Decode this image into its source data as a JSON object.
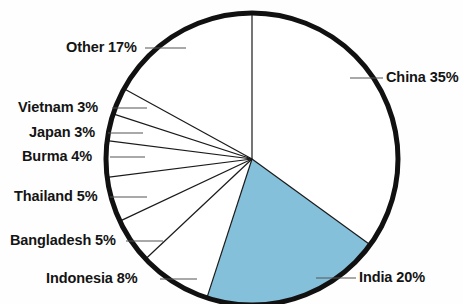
{
  "chart_data": {
    "type": "pie",
    "title": "",
    "subtitle": "",
    "xlabel": "",
    "ylabel": "",
    "legend_position": "none",
    "grid": false,
    "units": "percent",
    "start_angle_deg": 0,
    "direction": "clockwise",
    "categories": [
      "China",
      "India",
      "Indonesia",
      "Bangladesh",
      "Thailand",
      "Burma",
      "Japan",
      "Vietnam",
      "Other"
    ],
    "values": [
      35,
      20,
      8,
      5,
      5,
      4,
      3,
      3,
      17
    ],
    "slices": [
      {
        "name": "china-slice",
        "label": "China 35%",
        "category": "China",
        "value": 35,
        "value_text": "35%",
        "color": "#ffffff",
        "start_deg": 0,
        "end_deg": 126,
        "label_side": "right",
        "label_x": 386,
        "label_y": 70,
        "leader_x1": 350,
        "leader_y1": 78,
        "leader_x2": 383,
        "leader_y2": 78
      },
      {
        "name": "india-slice",
        "label": "India 20%",
        "category": "India",
        "value": 20,
        "value_text": "20%",
        "color": "#85c0db",
        "start_deg": 126,
        "end_deg": 198,
        "label_side": "right",
        "label_x": 359,
        "label_y": 270,
        "leader_x1": 316,
        "leader_y1": 278,
        "leader_x2": 356,
        "leader_y2": 278
      },
      {
        "name": "indonesia-slice",
        "label": "Indonesia 8%",
        "category": "Indonesia",
        "value": 8,
        "value_text": "8%",
        "color": "#ffffff",
        "start_deg": 198,
        "end_deg": 226.8,
        "label_side": "left",
        "label_x": 46,
        "label_y": 271,
        "leader_x1": 160,
        "leader_y1": 279,
        "leader_x2": 197,
        "leader_y2": 279
      },
      {
        "name": "bangladesh-slice",
        "label": "Bangladesh 5%",
        "category": "Bangladesh",
        "value": 5,
        "value_text": "5%",
        "color": "#ffffff",
        "start_deg": 226.8,
        "end_deg": 244.8,
        "label_side": "left",
        "label_x": 10,
        "label_y": 233,
        "leader_x1": 126,
        "leader_y1": 241,
        "leader_x2": 163,
        "leader_y2": 241
      },
      {
        "name": "thailand-slice",
        "label": "Thailand 5%",
        "category": "Thailand",
        "value": 5,
        "value_text": "5%",
        "color": "#ffffff",
        "start_deg": 244.8,
        "end_deg": 262.8,
        "label_side": "left",
        "label_x": 14,
        "label_y": 189,
        "leader_x1": 110,
        "leader_y1": 197,
        "leader_x2": 147,
        "leader_y2": 197
      },
      {
        "name": "burma-slice",
        "label": "Burma 4%",
        "category": "Burma",
        "value": 4,
        "value_text": "4%",
        "color": "#ffffff",
        "start_deg": 262.8,
        "end_deg": 277.2,
        "label_side": "left",
        "label_x": 22,
        "label_y": 149,
        "leader_x1": 110,
        "leader_y1": 157,
        "leader_x2": 145,
        "leader_y2": 157
      },
      {
        "name": "japan-slice",
        "label": "Japan 3%",
        "category": "Japan",
        "value": 3,
        "value_text": "3%",
        "color": "#ffffff",
        "start_deg": 277.2,
        "end_deg": 288,
        "label_side": "left",
        "label_x": 29,
        "label_y": 125,
        "leader_x1": 108,
        "leader_y1": 133,
        "leader_x2": 143,
        "leader_y2": 133
      },
      {
        "name": "vietnam-slice",
        "label": "Vietnam 3%",
        "category": "Vietnam",
        "value": 3,
        "value_text": "3%",
        "color": "#ffffff",
        "start_deg": 288,
        "end_deg": 298.8,
        "label_side": "left",
        "label_x": 18,
        "label_y": 100,
        "leader_x1": 112,
        "leader_y1": 108,
        "leader_x2": 147,
        "leader_y2": 108
      },
      {
        "name": "other-slice",
        "label": "Other 17%",
        "category": "Other",
        "value": 17,
        "value_text": "17%",
        "color": "#ffffff",
        "start_deg": 298.8,
        "end_deg": 360,
        "label_side": "left",
        "label_x": 66,
        "label_y": 40,
        "leader_x1": 145,
        "leader_y1": 48,
        "leader_x2": 186,
        "leader_y2": 48
      }
    ],
    "geometry": {
      "center_x": 252,
      "center_y": 159,
      "radius": 146,
      "outline_width": 5,
      "divider_width": 1.2
    },
    "colors": {
      "highlight": "#85c0db",
      "slice_fill": "#ffffff",
      "outline": "#111111",
      "divider": "#1a1a1a",
      "text": "#141414",
      "leader": "#555555",
      "background": "#fefefe"
    }
  }
}
